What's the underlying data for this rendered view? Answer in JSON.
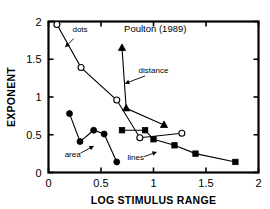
{
  "chart_data": {
    "type": "line",
    "title": "Poulton   (1989)",
    "xlabel": "LOG STIMULUS RANGE",
    "ylabel": "EXPONENT",
    "xlim": [
      0,
      2
    ],
    "ylim": [
      0,
      2
    ],
    "xticks": [
      "0",
      "0.5",
      "1",
      "1.5",
      "2"
    ],
    "xtick_values": [
      0,
      0.5,
      1,
      1.5,
      2
    ],
    "yticks": [
      "0",
      "0.5",
      "1",
      "1.5",
      "2"
    ],
    "ytick_values": [
      0,
      0.5,
      1,
      1.5,
      2
    ],
    "grid": false,
    "legend": "annotations-inline",
    "series": [
      {
        "name": "dots",
        "marker": "open-circle",
        "x": [
          0.08,
          0.31,
          0.65,
          0.87,
          1.27
        ],
        "y": [
          1.96,
          1.39,
          0.96,
          0.46,
          0.52
        ]
      },
      {
        "name": "distance",
        "marker": "filled-triangle",
        "x": [
          0.7,
          0.74,
          1.1
        ],
        "y": [
          1.65,
          0.85,
          0.63
        ]
      },
      {
        "name": "area",
        "marker": "filled-circle",
        "x": [
          0.2,
          0.3,
          0.43,
          0.53,
          0.65
        ],
        "y": [
          0.78,
          0.41,
          0.56,
          0.51,
          0.14
        ]
      },
      {
        "name": "lines",
        "marker": "filled-square",
        "x": [
          0.7,
          0.92,
          1.0,
          1.2,
          1.4,
          1.78
        ],
        "y": [
          0.56,
          0.56,
          0.44,
          0.36,
          0.25,
          0.14
        ]
      }
    ],
    "annotations": [
      {
        "label": "dots",
        "text_x": 0.3,
        "text_y": 1.86,
        "tip_x": 0.16,
        "tip_y": 1.66
      },
      {
        "label": "distance",
        "text_x": 1.0,
        "text_y": 1.32,
        "tip_x": 0.73,
        "tip_y": 1.18
      },
      {
        "label": "area",
        "text_x": 0.23,
        "text_y": 0.2,
        "tip_x": 0.43,
        "tip_y": 0.35
      },
      {
        "label": "lines",
        "text_x": 0.83,
        "text_y": 0.17,
        "tip_x": 1.03,
        "tip_y": 0.27
      }
    ]
  }
}
